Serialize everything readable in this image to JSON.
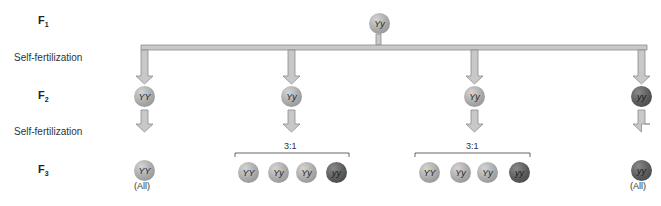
{
  "rows": {
    "f1": {
      "label": "F",
      "sub": "1"
    },
    "self_fert_1": "Self-fertilization",
    "f2": {
      "label": "F",
      "sub": "2"
    },
    "self_fert_2": "Self-fertilization",
    "f3": {
      "label": "F",
      "sub": "3"
    }
  },
  "f1_parent": {
    "genotype": "Yy",
    "shade": "light"
  },
  "f2": [
    {
      "genotype": "YY",
      "shade": "light"
    },
    {
      "genotype": "Yy",
      "shade": "light"
    },
    {
      "genotype": "Yy",
      "shade": "light"
    },
    {
      "genotype": "yy",
      "shade": "dark"
    }
  ],
  "f3": {
    "col1": {
      "genotypes": [
        "YY"
      ],
      "note": "(All)"
    },
    "col2": {
      "ratio": "3:1",
      "genotypes": [
        "YY",
        "Yy",
        "Yy",
        "yy"
      ]
    },
    "col3": {
      "ratio": "3:1",
      "genotypes": [
        "YY",
        "Yy",
        "Yy",
        "yy"
      ]
    },
    "col4": {
      "genotypes": [
        "yy"
      ],
      "note": "(All)"
    }
  },
  "colors": {
    "arrow_fill": "#c8c8c8",
    "arrow_stroke": "#8c8c8c",
    "light_ball": "#a8a8a8",
    "dark_ball": "#5a5a5a"
  }
}
